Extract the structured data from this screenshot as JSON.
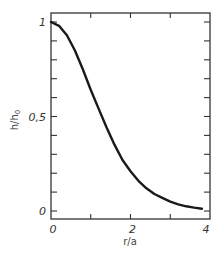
{
  "chart_data": {
    "type": "line",
    "title": "",
    "xlabel": "r/a",
    "ylabel": "h/h0",
    "ylabel_main": "h/h",
    "ylabel_sub": "0",
    "xlim": [
      0,
      4
    ],
    "ylim": [
      0,
      1
    ],
    "grid": false,
    "legend": null,
    "x_ticks": [
      0,
      2,
      4
    ],
    "x_tick_labels": [
      "0",
      "2",
      "4"
    ],
    "x_minor_ticks": [
      1,
      3
    ],
    "y_ticks": [
      0,
      0.5,
      1
    ],
    "y_tick_labels": [
      "0",
      "0,5",
      "1"
    ],
    "y_minor_ticks": [
      0.1,
      0.2,
      0.3,
      0.4,
      0.6,
      0.7,
      0.8,
      0.9
    ],
    "series": [
      {
        "name": "h/h0",
        "color": "#1a1a1a",
        "x": [
          0,
          0.2,
          0.4,
          0.6,
          0.8,
          1.0,
          1.2,
          1.4,
          1.6,
          1.8,
          2.0,
          2.2,
          2.4,
          2.6,
          2.8,
          3.0,
          3.2,
          3.4,
          3.6,
          3.8
        ],
        "y": [
          1.0,
          0.98,
          0.93,
          0.85,
          0.75,
          0.64,
          0.54,
          0.44,
          0.35,
          0.27,
          0.21,
          0.16,
          0.12,
          0.09,
          0.07,
          0.05,
          0.035,
          0.025,
          0.018,
          0.012
        ]
      }
    ]
  }
}
